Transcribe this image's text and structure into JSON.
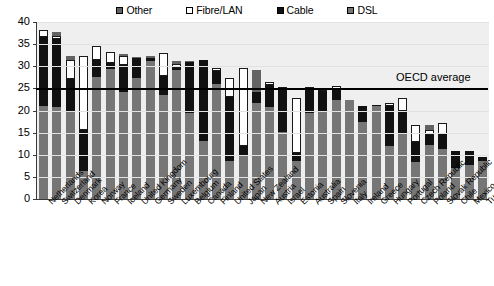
{
  "chart_data": {
    "type": "bar",
    "subtype": "stacked-bar",
    "title": "",
    "xlabel": "",
    "ylabel": "",
    "ylim": [
      0,
      40
    ],
    "yticks": [
      0,
      5,
      10,
      15,
      20,
      25,
      30,
      35,
      40
    ],
    "grid": true,
    "legend_position": "top-center",
    "legend": [
      "Other",
      "Fibre/LAN",
      "Cable",
      "DSL"
    ],
    "series_order_bottom_to_top": [
      "DSL",
      "Cable",
      "Fibre/LAN",
      "Other"
    ],
    "colors": {
      "Other": "#636363",
      "Fibre/LAN": "#ffffff",
      "Cable": "#111111",
      "DSL": "#767676"
    },
    "annotations": [
      {
        "label": "OECD average",
        "type": "hline",
        "value": 25.0
      }
    ],
    "categories": [
      "Netherlands",
      "Switzerland",
      "Denmark",
      "Korea",
      "Norway",
      "France",
      "Iceland",
      "United Kingdom",
      "Germany",
      "Sweden",
      "Luxembourg",
      "Belgium",
      "Canada",
      "Finland",
      "United States",
      "Japan",
      "New Zealand",
      "Austria",
      "Israel",
      "Estonia",
      "Australia",
      "Spain",
      "Slovenia",
      "Italy",
      "Ireland",
      "Greece",
      "Hungary",
      "Portugal",
      "Czech Republic",
      "Poland",
      "Slovak Republic",
      "Chile",
      "Mexico",
      "Turkey"
    ],
    "series": [
      {
        "name": "DSL",
        "values": [
          21.0,
          20.9,
          19.6,
          6.4,
          27.5,
          29.3,
          24.2,
          27.3,
          31.3,
          23.5,
          29.1,
          19.5,
          13.1,
          26.0,
          8.6,
          9.9,
          21.8,
          20.7,
          15.1,
          8.6,
          19.5,
          19.7,
          22.3,
          22.4,
          17.4,
          21.0,
          11.9,
          14.9,
          8.4,
          12.3,
          11.3,
          7.0,
          7.7,
          8.7
        ]
      },
      {
        "name": "Cable",
        "values": [
          15.6,
          15.2,
          7.6,
          9.2,
          3.9,
          1.4,
          6.1,
          4.5,
          0.5,
          4.4,
          0.6,
          11.5,
          18.3,
          3.0,
          14.5,
          2.1,
          2.3,
          5.0,
          9.5,
          1.7,
          5.2,
          4.7,
          2.5,
          0.0,
          3.6,
          0.2,
          9.1,
          5.0,
          4.5,
          2.2,
          3.3,
          3.9,
          3.2,
          0.7
        ]
      },
      {
        "name": "Fibre/LAN",
        "values": [
          1.6,
          0.6,
          4.3,
          16.7,
          3.2,
          2.5,
          2.0,
          0.0,
          0.0,
          5.0,
          0.9,
          0.0,
          0.0,
          0.5,
          4.3,
          17.5,
          0.0,
          0.3,
          0.3,
          12.5,
          0.1,
          0.4,
          0.3,
          0.0,
          0.0,
          0.0,
          0.5,
          3.0,
          3.8,
          1.0,
          2.6,
          0.0,
          0.0,
          0.0
        ]
      },
      {
        "name": "Other",
        "values": [
          0.0,
          1.0,
          0.8,
          0.0,
          0.0,
          0.0,
          0.5,
          0.4,
          0.6,
          0.0,
          0.5,
          0.3,
          0.0,
          0.0,
          0.0,
          0.0,
          5.0,
          0.0,
          0.0,
          0.0,
          0.0,
          0.0,
          0.0,
          0.0,
          0.0,
          0.0,
          0.0,
          0.0,
          0.0,
          1.2,
          0.0,
          0.0,
          0.0,
          0.0
        ]
      }
    ],
    "totals": [
      38.2,
      37.7,
      32.3,
      32.3,
      34.6,
      33.2,
      32.8,
      32.2,
      32.4,
      32.9,
      31.1,
      31.3,
      31.4,
      29.5,
      27.4,
      29.5,
      29.1,
      26.0,
      24.9,
      22.8,
      24.8,
      24.8,
      25.1,
      22.4,
      21.0,
      21.2,
      21.5,
      22.9,
      16.7,
      16.7,
      17.2,
      10.9,
      10.9,
      9.4
    ]
  },
  "legend": {
    "items": [
      {
        "label": "Other",
        "swatch": "other"
      },
      {
        "label": "Fibre/LAN",
        "swatch": "fibre"
      },
      {
        "label": "Cable",
        "swatch": "cable"
      },
      {
        "label": "DSL",
        "swatch": "dsl"
      }
    ]
  },
  "annotation": {
    "oecd_average_label": "OECD average"
  }
}
